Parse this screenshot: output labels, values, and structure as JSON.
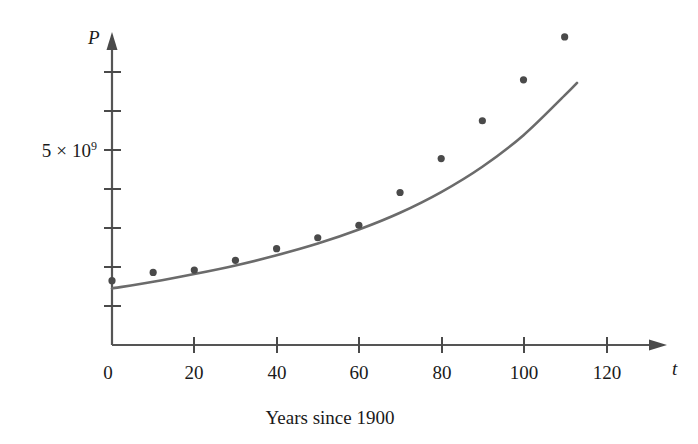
{
  "chart_data": {
    "type": "scatter",
    "title": "",
    "subtitle": "",
    "caption": "Years since 1900",
    "xlabel": "t",
    "ylabel": "P",
    "xlim": [
      -3,
      128
    ],
    "ylim": [
      0,
      8.8
    ],
    "grid": false,
    "legend": null,
    "x_ticks": [
      0,
      20,
      40,
      60,
      80,
      100,
      120
    ],
    "x_tick_labels": [
      "0",
      "20",
      "40",
      "60",
      "80",
      "100",
      "120"
    ],
    "y_ticks": [
      1,
      2,
      3,
      4,
      5,
      6,
      7
    ],
    "y_tick_labels": [
      "",
      "",
      "",
      "",
      "5 × 10⁹",
      "",
      ""
    ],
    "y_label_mantissa": "5",
    "y_label_times": "×",
    "y_label_base": "10",
    "y_label_exponent": "9",
    "y_unit_note": "values in units of 10^9",
    "series": [
      {
        "name": "population-data-points",
        "type": "scatter",
        "marker": "filled-circle",
        "color": "#4a4a4a",
        "x": [
          0,
          10,
          20,
          30,
          40,
          50,
          60,
          70,
          80,
          90,
          100,
          110
        ],
        "y": [
          1.65,
          1.86,
          1.92,
          2.17,
          2.47,
          2.75,
          3.07,
          3.91,
          4.78,
          5.75,
          6.8,
          7.9
        ]
      },
      {
        "name": "fitted-exponential-curve",
        "type": "line",
        "color": "#6b6b6b",
        "x": [
          0,
          10,
          20,
          30,
          40,
          50,
          60,
          70,
          80,
          90,
          100,
          110,
          113
        ],
        "y": [
          1.45,
          1.62,
          1.82,
          2.04,
          2.3,
          2.6,
          2.96,
          3.39,
          3.92,
          4.57,
          5.38,
          6.4,
          6.72
        ]
      }
    ],
    "axis_arrows": [
      "x-positive",
      "y-positive"
    ]
  },
  "figure": {
    "origin_label": "0"
  }
}
